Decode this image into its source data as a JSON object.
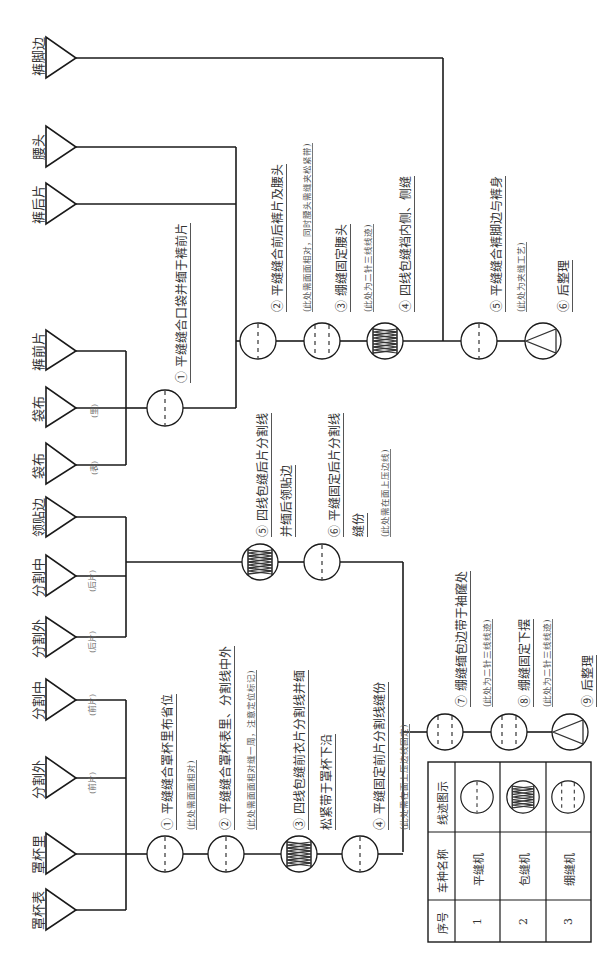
{
  "diagram": {
    "type": "garment-sewing-process-flowchart",
    "orientation": "rotated-90-ccw",
    "pants_section": {
      "inputs": [
        {
          "label": "袋布",
          "sub": "(表)"
        },
        {
          "label": "袋布",
          "sub": "(里)"
        },
        {
          "label": "裤前片",
          "sub": ""
        },
        {
          "label": "裤后片",
          "sub": ""
        },
        {
          "label": "腰头",
          "sub": ""
        },
        {
          "label": "裤脚边",
          "sub": ""
        }
      ],
      "steps": [
        {
          "num": "①",
          "text": "平缝缝合口袋并缅于裤前片",
          "note": ""
        },
        {
          "num": "②",
          "text": "平缝缝合前后裤片及腰头",
          "note": "(此处需面面相对，同时腰头需缝夹松紧带)"
        },
        {
          "num": "③",
          "text": "绷缝固定腰头",
          "note": "(此处为二针三线线迹)"
        },
        {
          "num": "④",
          "text": "四线包缝裆内侧、侧缝",
          "note": ""
        },
        {
          "num": "⑤",
          "text": "平缝缝合裤脚边与裤身",
          "note": "(此处为夹缝工艺)"
        },
        {
          "num": "⑥",
          "text": "后整理",
          "note": ""
        }
      ]
    },
    "top_section": {
      "inputs": [
        {
          "label": "罩杯表",
          "sub": ""
        },
        {
          "label": "罩杯里",
          "sub": ""
        },
        {
          "label": "分割外",
          "sub": "(前片)"
        },
        {
          "label": "分割中",
          "sub": "(前片)"
        },
        {
          "label": "分割外",
          "sub": "(后片)"
        },
        {
          "label": "分割中",
          "sub": "(后片)"
        },
        {
          "label": "领贴边",
          "sub": ""
        }
      ],
      "steps": [
        {
          "num": "①",
          "text": "平缝缝合罩杯里布省位",
          "note": "(此处需面面相对)"
        },
        {
          "num": "②",
          "text": "平缝缝合罩杯表里、分割线中外",
          "note": "(此处需面面相对缝一周，注意定位标记)"
        },
        {
          "num": "③",
          "text": "四线包缝前衣片分割线并缅",
          "text2": "松紧带于罩杯下沿",
          "note": ""
        },
        {
          "num": "④",
          "text": "平缝固定前片分割线缝份",
          "note": "(此处需在面上压边线固定)"
        },
        {
          "num": "⑤",
          "text": "四线包缝后片分割线",
          "text2": "并缅后领贴边",
          "note": ""
        },
        {
          "num": "⑥",
          "text": "平缝固定后片分割线",
          "text2": "缝份",
          "note": "(此处需在面上压边线)"
        },
        {
          "num": "⑦",
          "text": "绷缝缅包边带于袖窿处",
          "note": "(此处为二针三线线迹)"
        },
        {
          "num": "⑧",
          "text": "绷缝固定下摆",
          "note": "(此处为二针三线线迹)"
        },
        {
          "num": "⑨",
          "text": "后整理",
          "note": ""
        }
      ]
    },
    "legend_table": {
      "headers": [
        "序号",
        "车种名称",
        "线迹图示"
      ],
      "rows": [
        {
          "index": "1",
          "machine": "平缝机",
          "stitch_icon": "lockstitch-single-dash-icon"
        },
        {
          "index": "2",
          "machine": "包缝机",
          "stitch_icon": "overlock-zigzag-icon"
        },
        {
          "index": "3",
          "machine": "绷缝机",
          "stitch_icon": "coverstitch-double-dash-icon"
        }
      ]
    }
  }
}
